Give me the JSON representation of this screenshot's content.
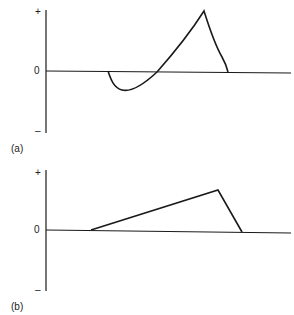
{
  "panels": [
    {
      "id": "a",
      "label": "(a)",
      "y_ticks": {
        "plus": "+",
        "zero": "0",
        "minus": "–"
      },
      "description": "Curve dips below zero then rises to a sharp positive peak and falls back to zero"
    },
    {
      "id": "b",
      "label": "(b)",
      "y_ticks": {
        "plus": "+",
        "zero": "0",
        "minus": "–"
      },
      "description": "Triangular waveform: linear ramp up from zero to peak then sharp drop to zero"
    }
  ],
  "colors": {
    "line": "#1a1a1a",
    "background": "#ffffff"
  }
}
